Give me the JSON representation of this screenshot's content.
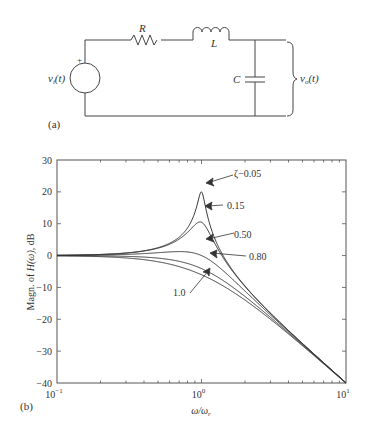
{
  "circuit": {
    "panel_label": "(a)",
    "source_label": "v",
    "source_sub": "i",
    "source_arg": "(t)",
    "source_polarity": "+",
    "resistor_label": "R",
    "inductor_label": "L",
    "capacitor_label": "C",
    "output_label": "v",
    "output_sub": "o",
    "output_arg": "(t)"
  },
  "plot": {
    "panel_label": "(b)",
    "ylabel_prefix": "Magn. of ",
    "ylabel_func": "H(ω)",
    "ylabel_suffix": ", dB",
    "xlabel": "ω/ω",
    "xlabel_sub": "r",
    "yticks": [
      "30",
      "20",
      "10",
      "0",
      "−10",
      "−20",
      "−30",
      "−40"
    ],
    "xticks": [
      {
        "base": "10",
        "exp": "−1"
      },
      {
        "base": "10",
        "exp": "0"
      },
      {
        "base": "10",
        "exp": "1"
      }
    ],
    "annotations": [
      "ζ−0.05",
      "0.15",
      "0.50",
      "0.80",
      "1.0"
    ]
  },
  "chart_data": {
    "type": "line",
    "title": "",
    "xlabel": "ω/ω_r",
    "ylabel": "Magn. of H(ω), dB",
    "xscale": "log",
    "xlim": [
      0.1,
      10
    ],
    "ylim": [
      -40,
      30
    ],
    "xticks": [
      0.1,
      1,
      10
    ],
    "yticks": [
      30,
      20,
      10,
      0,
      -10,
      -20,
      -30,
      -40
    ],
    "grid": false,
    "legend": "annotations with arrows",
    "series": [
      {
        "name": "ζ=0.05",
        "zeta": 0.05,
        "peak_db": 20.0,
        "x": [
          0.1,
          0.5,
          0.9,
          1.0,
          2,
          10
        ],
        "y": [
          0.09,
          2.5,
          14.0,
          20.0,
          -9.6,
          -39.9
        ]
      },
      {
        "name": "ζ=0.15",
        "zeta": 0.15,
        "peak_db": 10.5,
        "x": [
          0.1,
          0.5,
          0.9,
          1.0,
          2,
          10
        ],
        "y": [
          0.09,
          2.4,
          10.0,
          10.5,
          -9.7,
          -39.9
        ]
      },
      {
        "name": "ζ=0.50",
        "zeta": 0.5,
        "peak_db": 1.25,
        "x": [
          0.1,
          0.5,
          0.9,
          1.0,
          2,
          10
        ],
        "y": [
          0.08,
          1.9,
          1.1,
          0.0,
          -10.6,
          -40.0
        ]
      },
      {
        "name": "ζ=0.80",
        "zeta": 0.8,
        "peak_db": 0.0,
        "x": [
          0.1,
          0.5,
          0.9,
          1.0,
          2,
          10
        ],
        "y": [
          0.0,
          0.9,
          -2.4,
          -4.1,
          -11.8,
          -40.1
        ]
      },
      {
        "name": "ζ=1.0",
        "zeta": 1.0,
        "peak_db": 0.0,
        "x": [
          0.1,
          0.5,
          0.9,
          1.0,
          2,
          10
        ],
        "y": [
          -0.09,
          -1.9,
          -5.1,
          -6.0,
          -14.0,
          -40.1
        ]
      }
    ]
  }
}
